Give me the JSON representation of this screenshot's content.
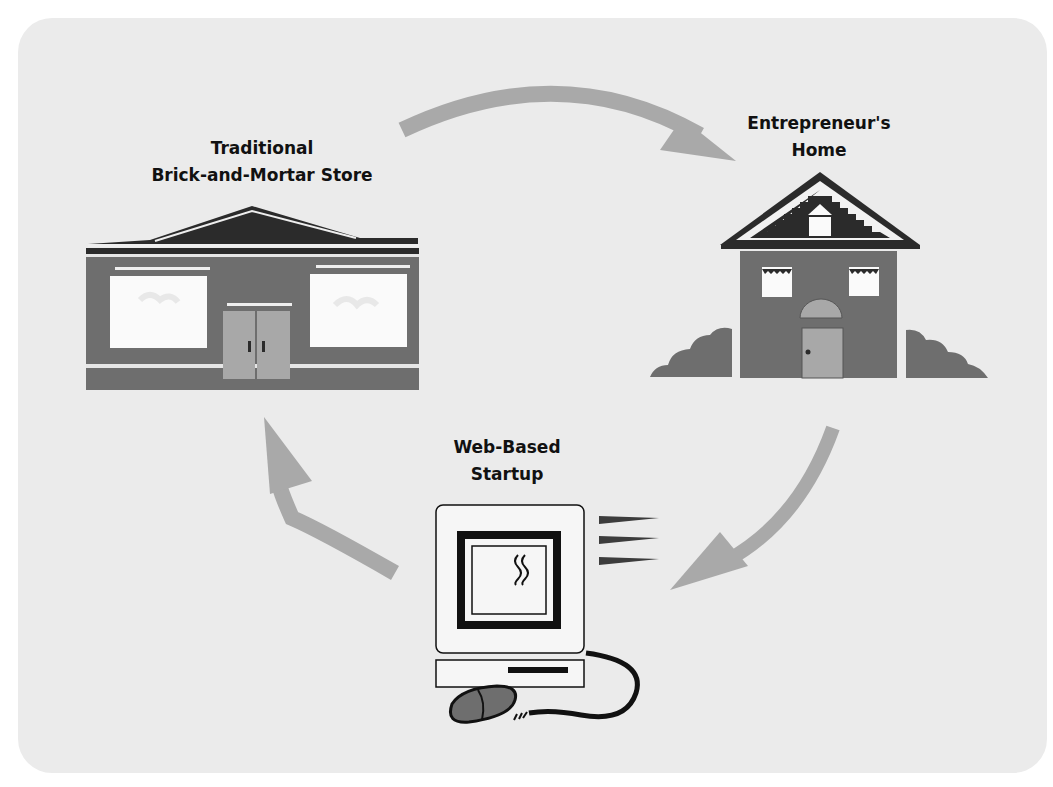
{
  "diagram": {
    "type": "cycle",
    "nodes": [
      {
        "id": "store",
        "label_lines": [
          "Traditional",
          "Brick-and-Mortar Store"
        ],
        "icon": "storefront-icon"
      },
      {
        "id": "home",
        "label_lines": [
          "Entrepreneur's",
          "Home"
        ],
        "icon": "house-icon"
      },
      {
        "id": "web",
        "label_lines": [
          "Web-Based",
          "Startup"
        ],
        "icon": "computer-icon"
      }
    ],
    "edges": [
      {
        "from": "store",
        "to": "home",
        "icon": "curved-arrow-icon"
      },
      {
        "from": "home",
        "to": "web",
        "icon": "curved-arrow-icon"
      },
      {
        "from": "web",
        "to": "store",
        "icon": "curved-arrow-icon"
      }
    ]
  },
  "colors": {
    "panel": "#ebebeb",
    "arrow": "#a9a9a9",
    "building_body": "#6e6e6e",
    "roof_dark": "#2b2b2b",
    "door": "#a8a8a8",
    "window": "#fafafa",
    "text": "#111111"
  }
}
